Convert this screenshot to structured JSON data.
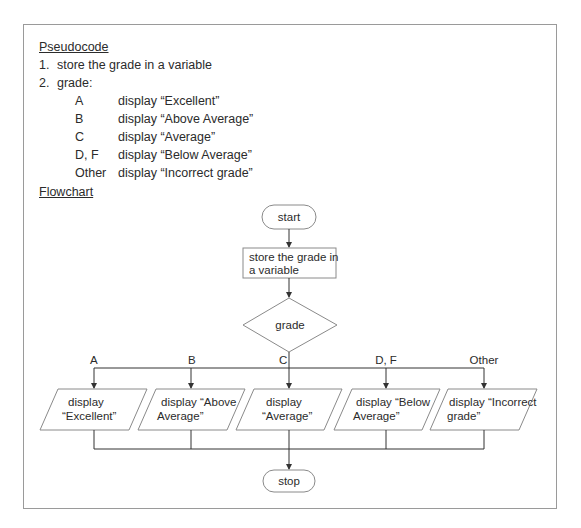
{
  "pseudocode": {
    "heading": "Pseudocode",
    "steps": [
      {
        "num": "1.",
        "text": "store the grade in a variable"
      },
      {
        "num": "2.",
        "text": "grade:"
      }
    ],
    "cases": [
      {
        "grade": "A",
        "action": "display “Excellent”"
      },
      {
        "grade": "B",
        "action": "display “Above Average”"
      },
      {
        "grade": "C",
        "action": "display “Average”"
      },
      {
        "grade": "D, F",
        "action": "display “Below Average”"
      },
      {
        "grade": "Other",
        "action": "display “Incorrect grade”"
      }
    ]
  },
  "flowchart": {
    "heading": "Flowchart",
    "start": "start",
    "process": [
      "store the grade in",
      "a variable"
    ],
    "decision": "grade",
    "branches": [
      {
        "label": "A",
        "lines": [
          "display",
          "“Excellent”"
        ]
      },
      {
        "label": "B",
        "lines": [
          "display “Above",
          "Average”"
        ]
      },
      {
        "label": "C",
        "lines": [
          "display",
          "“Average”"
        ]
      },
      {
        "label": "D, F",
        "lines": [
          "display “Below",
          "Average”"
        ]
      },
      {
        "label": "Other",
        "lines": [
          "display “Incorrect",
          "grade”"
        ]
      }
    ],
    "stop": "stop",
    "colors": {
      "line": "#333333",
      "shape_border": "#8a8a8a",
      "text": "#2b2b2b",
      "frame": "#9a9a9a"
    }
  }
}
